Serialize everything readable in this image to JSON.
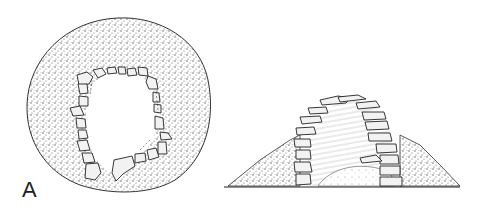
{
  "figure": {
    "panel_label": "A",
    "views": [
      {
        "name": "plan-view",
        "description": "Circular stone-ringed structure in plan, with entrance gap at bottom"
      },
      {
        "name": "section-elevation",
        "description": "Corbelled stone chamber within earthen mound, cross-section"
      }
    ],
    "colors": {
      "ink": "#222222",
      "stipple": "#555555",
      "stone": "#f2f2f2",
      "background": "#ffffff"
    }
  }
}
